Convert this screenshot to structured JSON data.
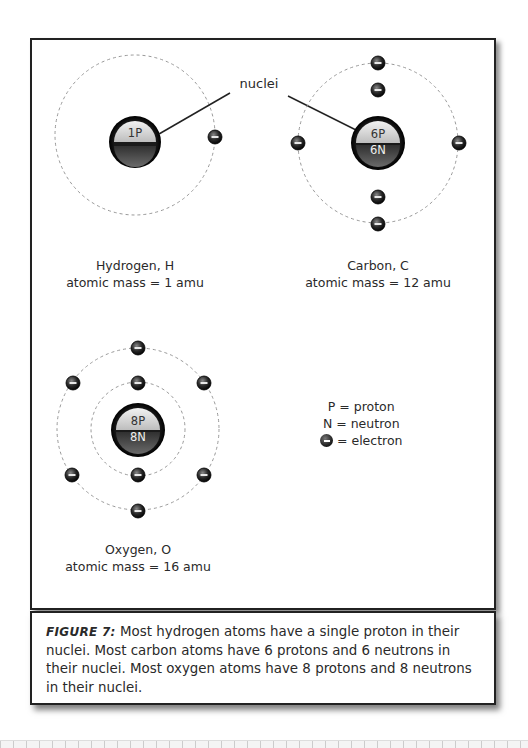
{
  "diagram": {
    "pointer_label": "nuclei",
    "atoms": [
      {
        "name": "Hydrogen, H",
        "mass": "atomic mass = 1 amu",
        "nucleus_top": "1P",
        "nucleus_bottom": "",
        "electrons": 1
      },
      {
        "name": "Carbon, C",
        "mass": "atomic mass = 12 amu",
        "nucleus_top": "6P",
        "nucleus_bottom": "6N",
        "electrons": 6
      },
      {
        "name": "Oxygen, O",
        "mass": "atomic mass = 16 amu",
        "nucleus_top": "8P",
        "nucleus_bottom": "8N",
        "electrons": 8
      }
    ],
    "legend": {
      "proton": "P = proton",
      "neutron": "N = neutron",
      "electron": "= electron"
    }
  },
  "caption": {
    "figure_label": "FIGURE 7:",
    "text": " Most hydrogen atoms have a single proton in their nuclei. Most carbon atoms have 6 protons and 6 neutrons in their nuclei. Most oxygen atoms have 8 protons and 8 neutrons in their nuclei."
  }
}
